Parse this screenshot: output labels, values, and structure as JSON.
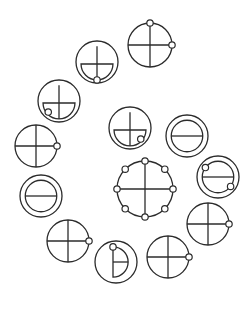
{
  "diagram": {
    "type": "symbol-spiral",
    "background": "#ffffff",
    "stroke_color": "#2b2b2b",
    "symbols": [
      {
        "id": "A",
        "kind": "cross",
        "cx": 150,
        "cy": 45,
        "r": 22,
        "dots": [
          "top",
          "right"
        ]
      },
      {
        "id": "B",
        "kind": "bowl",
        "cx": 97,
        "cy": 62,
        "r": 21,
        "dots": [
          "bottom"
        ]
      },
      {
        "id": "C",
        "kind": "bowl",
        "cx": 59,
        "cy": 101,
        "r": 21,
        "dots": [
          "bottom-left"
        ]
      },
      {
        "id": "D",
        "kind": "bowl",
        "cx": 130,
        "cy": 128,
        "r": 21,
        "dots": [
          "bottom-right"
        ]
      },
      {
        "id": "E",
        "kind": "double-bar",
        "cx": 187,
        "cy": 136,
        "r": 21,
        "dots": []
      },
      {
        "id": "F",
        "kind": "cross",
        "cx": 36,
        "cy": 146,
        "r": 21,
        "dots": [
          "right"
        ]
      },
      {
        "id": "G",
        "kind": "cross-eight",
        "cx": 145,
        "cy": 189,
        "r": 28,
        "dots": [
          "n",
          "ne",
          "e",
          "se",
          "s",
          "sw",
          "w",
          "nw"
        ]
      },
      {
        "id": "H",
        "kind": "double-bar",
        "cx": 218,
        "cy": 177,
        "r": 21,
        "dots": [
          "top-left",
          "bottom-right"
        ]
      },
      {
        "id": "I",
        "kind": "double-bar",
        "cx": 41,
        "cy": 196,
        "r": 21,
        "dots": []
      },
      {
        "id": "J",
        "kind": "cross",
        "cx": 68,
        "cy": 241,
        "r": 21,
        "dots": [
          "right"
        ]
      },
      {
        "id": "K",
        "kind": "d-shape",
        "cx": 116,
        "cy": 262,
        "r": 21,
        "dots": [
          "top"
        ]
      },
      {
        "id": "L",
        "kind": "cross",
        "cx": 168,
        "cy": 257,
        "r": 21,
        "dots": [
          "right"
        ]
      },
      {
        "id": "M",
        "kind": "cross",
        "cx": 208,
        "cy": 224,
        "r": 21,
        "dots": [
          "right"
        ]
      }
    ]
  }
}
